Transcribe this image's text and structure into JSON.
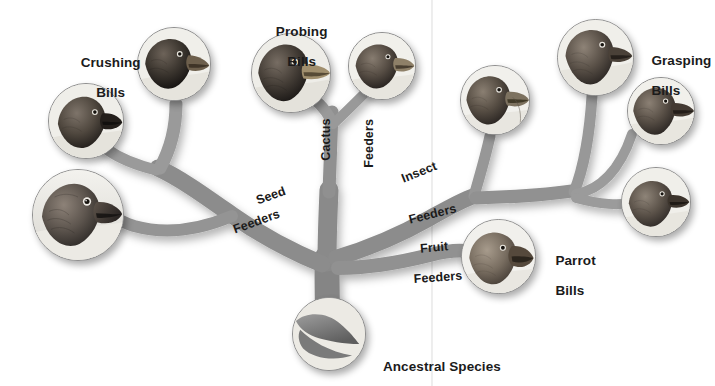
{
  "figure": {
    "type": "adaptive-radiation-tree",
    "background_color": "#ffffff",
    "branch_color": "#8a8a8a",
    "text_color": "#1b1b1b"
  },
  "root": {
    "label": "Ancestral Species",
    "circle": {
      "cx": 328,
      "cy": 333,
      "r": 36
    }
  },
  "group_labels": [
    {
      "id": "crushing",
      "line1": "Crushing",
      "line2": "Bills",
      "x": 72,
      "y": 44
    },
    {
      "id": "probing",
      "line1": "Probing",
      "line2": "Bills",
      "x": 275,
      "y": 14
    },
    {
      "id": "grasping",
      "line1": "Grasping",
      "line2": "Bills",
      "x": 639,
      "y": 40
    },
    {
      "id": "parrot",
      "line1": "Parrot",
      "line2": "Bills",
      "x": 541,
      "y": 240
    }
  ],
  "branch_labels": [
    {
      "id": "seed",
      "line1": "Seed",
      "line2": "Feeders",
      "rotation_deg": -20
    },
    {
      "id": "cactus",
      "line1": "Cactus",
      "line2": "Feeders",
      "rotation_deg": -90
    },
    {
      "id": "insect",
      "line1": "Insect",
      "line2": "Feeders",
      "rotation_deg": -22
    },
    {
      "id": "fruit",
      "line1": "Fruit",
      "line2": "Feeders",
      "rotation_deg": 0
    }
  ],
  "branch_label_text": {
    "seed_1": "Seed",
    "seed_2": "Feeders",
    "cactus_1": "Cactus",
    "cactus_2": "Feeders",
    "insect_1": "Insect",
    "insect_2": "Feeders",
    "fruit_1": "Fruit",
    "fruit_2": "Feeders"
  },
  "bird_circles": [
    {
      "id": "crushing-large-bill",
      "group": "crushing",
      "cx": 77,
      "cy": 214,
      "r": 45,
      "facing": "right"
    },
    {
      "id": "crushing-medium-bill",
      "group": "crushing",
      "cx": 85,
      "cy": 120,
      "r": 37,
      "facing": "right"
    },
    {
      "id": "crushing-small-bill",
      "group": "crushing",
      "cx": 173,
      "cy": 63,
      "r": 36,
      "facing": "right"
    },
    {
      "id": "probing-cactus-bill",
      "group": "probing",
      "cx": 290,
      "cy": 72,
      "r": 39,
      "facing": "right"
    },
    {
      "id": "probing-seed-bill",
      "group": "probing",
      "cx": 381,
      "cy": 65,
      "r": 33,
      "facing": "right"
    },
    {
      "id": "insect-feeder-bill",
      "group": "insect",
      "cx": 494,
      "cy": 99,
      "r": 34,
      "facing": "right"
    },
    {
      "id": "grasping-upper-bill",
      "group": "grasping",
      "cx": 594,
      "cy": 56,
      "r": 38,
      "facing": "right"
    },
    {
      "id": "grasping-lower-bill",
      "group": "grasping",
      "cx": 660,
      "cy": 110,
      "r": 33,
      "facing": "right"
    },
    {
      "id": "grasping-bottom-bill",
      "group": "grasping",
      "cx": 655,
      "cy": 201,
      "r": 34,
      "facing": "right"
    },
    {
      "id": "parrot-bill",
      "group": "parrot",
      "cx": 497,
      "cy": 255,
      "r": 36,
      "facing": "right"
    }
  ],
  "scan_seam": {
    "x": 432,
    "visible": true
  }
}
